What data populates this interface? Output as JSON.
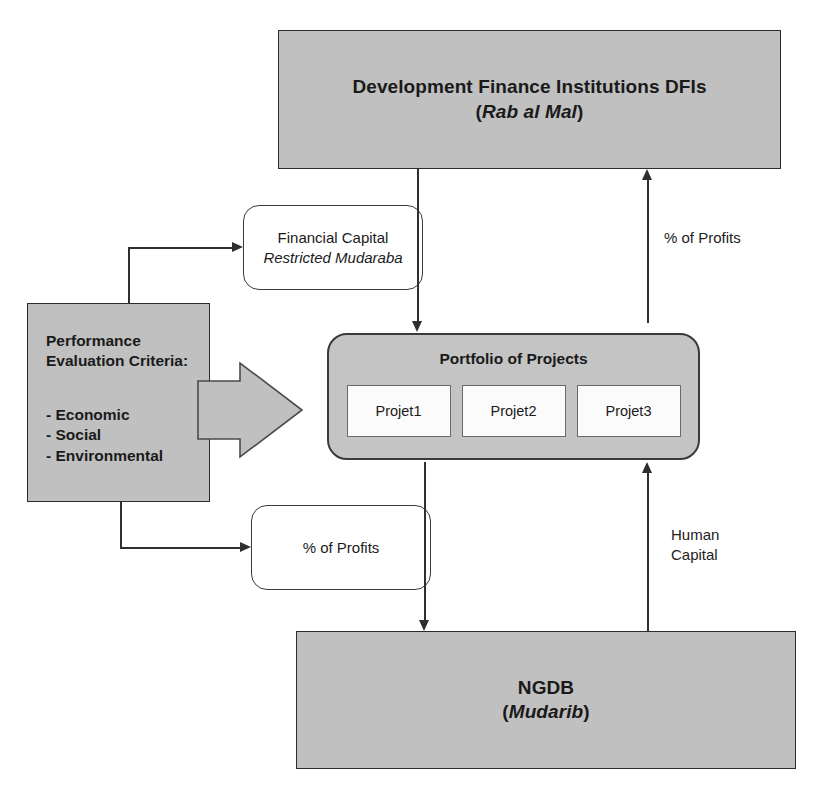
{
  "diagram": {
    "colors": {
      "filled_node": "#c0c0c0",
      "portfolio_node": "#c4c4c4",
      "project_card": "#fbfbfb",
      "stroke": "#2f2f2f",
      "text": "#1a1a1a"
    }
  },
  "nodes": {
    "dfi": {
      "line1": "Development Finance Institutions DFIs",
      "line2_open": "(",
      "line2_italic": "Rab al Mal",
      "line2_close": ")"
    },
    "financial_capital": {
      "line1": "Financial Capital",
      "line2": "Restricted Mudaraba"
    },
    "criteria": {
      "title_line1": "Performance",
      "title_line2": "Evaluation Criteria:",
      "items": [
        "- Economic",
        "- Social",
        "- Environmental"
      ]
    },
    "portfolio": {
      "title": "Portfolio of Projects",
      "projects": [
        "Projet1",
        "Projet2",
        "Projet3"
      ]
    },
    "profits_box": {
      "label": "% of Profits"
    },
    "ngdb": {
      "line1": "NGDB",
      "line2_open": "(",
      "line2_italic": "Mudarib",
      "line2_close": ")"
    }
  },
  "labels": {
    "profits_right": "% of Profits",
    "human_capital": "Human\nCapital"
  },
  "edges": [
    {
      "name": "dfi-to-portfolio",
      "from": "dfi",
      "to": "portfolio",
      "direction": "down"
    },
    {
      "name": "portfolio-to-dfi",
      "from": "portfolio",
      "to": "dfi",
      "direction": "up",
      "label": "% of Profits"
    },
    {
      "name": "criteria-to-financial-capital",
      "from": "criteria",
      "to": "financial_capital",
      "direction": "right"
    },
    {
      "name": "criteria-to-profits",
      "from": "criteria",
      "to": "profits_box",
      "direction": "right"
    },
    {
      "name": "criteria-to-portfolio",
      "from": "criteria",
      "to": "portfolio",
      "direction": "right",
      "style": "block-arrow"
    },
    {
      "name": "portfolio-to-ngdb",
      "from": "portfolio",
      "to": "ngdb",
      "direction": "down"
    },
    {
      "name": "ngdb-to-portfolio",
      "from": "ngdb",
      "to": "portfolio",
      "direction": "up",
      "label": "Human Capital"
    }
  ]
}
